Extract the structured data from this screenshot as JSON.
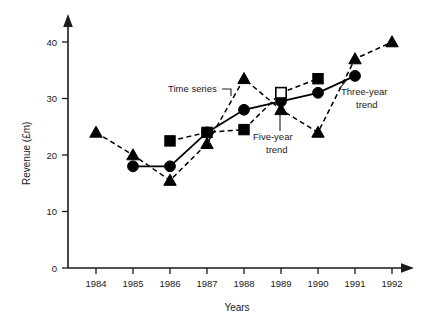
{
  "chart_data": {
    "type": "line",
    "title": "",
    "xlabel": "Years",
    "ylabel": "Revenue (£m)",
    "x": [
      "1984",
      "1985",
      "1986",
      "1987",
      "1988",
      "1989",
      "1990",
      "1991",
      "1992"
    ],
    "xlim": [
      1983.5,
      1992.6
    ],
    "ylim": [
      0,
      43
    ],
    "yticks": [
      0,
      10,
      20,
      30,
      40
    ],
    "yticklabels": [
      "0",
      "10",
      "20",
      "30",
      "40"
    ],
    "grid": false,
    "legend": "none (inline annotations)",
    "series": [
      {
        "name": "Time series",
        "marker": "triangle-filled",
        "line": "dashed",
        "x": [
          "1984",
          "1985",
          "1986",
          "1987",
          "1988",
          "1989",
          "1990",
          "1991",
          "1992"
        ],
        "values": [
          24,
          20,
          15.5,
          22,
          33.5,
          28,
          24,
          37,
          40
        ]
      },
      {
        "name": "Three-year trend",
        "marker": "circle-filled",
        "line": "solid",
        "x": [
          "1985",
          "1986",
          "1987",
          "1988",
          "1989",
          "1990",
          "1991"
        ],
        "values": [
          18,
          18,
          24,
          28,
          29.5,
          31,
          34
        ]
      },
      {
        "name": "Five-year trend",
        "marker": "square-filled",
        "line": "dashed",
        "x": [
          "1986",
          "1987",
          "1988",
          "1989",
          "1990"
        ],
        "values": [
          22.5,
          24,
          24.5,
          31,
          33.5
        ],
        "open_marker_index": 3
      }
    ],
    "annotations": [
      {
        "id": "time-series",
        "text": "Time series",
        "lines": [
          "Time series"
        ]
      },
      {
        "id": "five-year-trend",
        "text": "Five-year trend",
        "lines": [
          "Five-year",
          "trend"
        ]
      },
      {
        "id": "three-year-trend",
        "text": "Three-year trend",
        "lines": [
          "Three-year",
          "trend"
        ]
      }
    ],
    "colors": {
      "ink": "#000000",
      "background": "#ffffff"
    }
  }
}
